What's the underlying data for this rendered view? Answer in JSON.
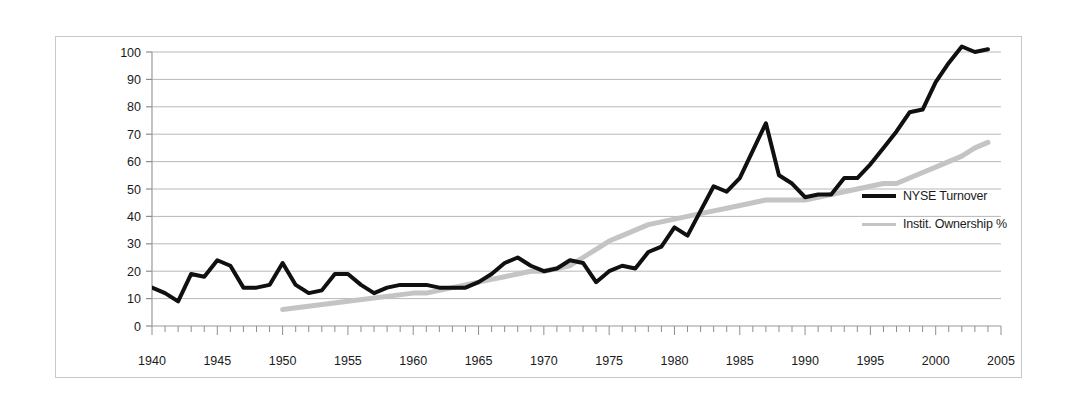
{
  "chart_data": {
    "type": "line",
    "title": "",
    "xlabel": "",
    "ylabel": "",
    "xlim": [
      1940,
      2005
    ],
    "ylim": [
      0,
      100
    ],
    "ytick_step": 10,
    "xtick_step": 5,
    "minor_xtick_step": 1,
    "grid": true,
    "grid_axis": "y",
    "legend_position": "right",
    "yticks": [
      0,
      10,
      20,
      30,
      40,
      50,
      60,
      70,
      80,
      90,
      100
    ],
    "xticks": [
      1940,
      1945,
      1950,
      1955,
      1960,
      1965,
      1970,
      1975,
      1980,
      1985,
      1990,
      1995,
      2000,
      2005
    ],
    "series": [
      {
        "name": "NYSE Turnover",
        "color": "#101010",
        "line_width": 4,
        "x": [
          1940,
          1941,
          1942,
          1943,
          1944,
          1945,
          1946,
          1947,
          1948,
          1949,
          1950,
          1951,
          1952,
          1953,
          1954,
          1955,
          1956,
          1957,
          1958,
          1959,
          1960,
          1961,
          1962,
          1963,
          1964,
          1965,
          1966,
          1967,
          1968,
          1969,
          1970,
          1971,
          1972,
          1973,
          1974,
          1975,
          1976,
          1977,
          1978,
          1979,
          1980,
          1981,
          1982,
          1983,
          1984,
          1985,
          1986,
          1987,
          1988,
          1989,
          1990,
          1991,
          1992,
          1993,
          1994,
          1995,
          1996,
          1997,
          1998,
          1999,
          2000,
          2001,
          2002,
          2003,
          2004
        ],
        "values": [
          14,
          12,
          9,
          19,
          18,
          24,
          22,
          14,
          14,
          15,
          23,
          15,
          12,
          13,
          19,
          19,
          15,
          12,
          14,
          15,
          15,
          15,
          14,
          14,
          14,
          16,
          19,
          23,
          25,
          22,
          20,
          21,
          24,
          23,
          16,
          20,
          22,
          21,
          27,
          29,
          36,
          33,
          42,
          51,
          49,
          54,
          64,
          74,
          55,
          52,
          47,
          48,
          48,
          54,
          54,
          59,
          65,
          71,
          78,
          79,
          89,
          96,
          102,
          100,
          101
        ]
      },
      {
        "name": "Instit. Ownership %",
        "color": "#c4c4c4",
        "line_width": 5,
        "x": [
          1950,
          1955,
          1960,
          1961,
          1962,
          1963,
          1964,
          1965,
          1966,
          1967,
          1968,
          1969,
          1970,
          1971,
          1972,
          1973,
          1974,
          1975,
          1976,
          1977,
          1978,
          1979,
          1980,
          1981,
          1982,
          1983,
          1984,
          1985,
          1986,
          1987,
          1988,
          1989,
          1990,
          1991,
          1992,
          1993,
          1994,
          1995,
          1996,
          1997,
          1998,
          1999,
          2000,
          2001,
          2002,
          2003,
          2004
        ],
        "values": [
          6,
          9,
          12,
          12,
          13,
          14,
          15,
          16,
          17,
          18,
          19,
          20,
          20,
          21,
          22,
          25,
          28,
          31,
          33,
          35,
          37,
          38,
          39,
          40,
          41,
          42,
          43,
          44,
          45,
          46,
          46,
          46,
          46,
          47,
          48,
          49,
          50,
          51,
          52,
          52,
          54,
          56,
          58,
          60,
          62,
          65,
          67
        ]
      }
    ]
  },
  "legend": {
    "items": [
      {
        "label": "NYSE Turnover",
        "swatch": "series-black"
      },
      {
        "label": "Instit. Ownership %",
        "swatch": "series-gray"
      }
    ]
  }
}
